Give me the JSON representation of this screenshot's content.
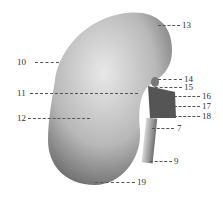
{
  "figure": {
    "labels": [
      {
        "id": "13",
        "x": 182,
        "y": 21
      },
      {
        "id": "10",
        "x": 17,
        "y": 58
      },
      {
        "id": "14",
        "x": 184,
        "y": 75
      },
      {
        "id": "15",
        "x": 184,
        "y": 83
      },
      {
        "id": "11",
        "x": 17,
        "y": 89
      },
      {
        "id": "16",
        "x": 202,
        "y": 92
      },
      {
        "id": "17",
        "x": 202,
        "y": 102
      },
      {
        "id": "12",
        "x": 17,
        "y": 114
      },
      {
        "id": "18",
        "x": 202,
        "y": 112
      },
      {
        "id": "7",
        "x": 177,
        "y": 124
      },
      {
        "id": "9",
        "x": 174,
        "y": 157
      },
      {
        "id": "19",
        "x": 137,
        "y": 178
      }
    ]
  }
}
